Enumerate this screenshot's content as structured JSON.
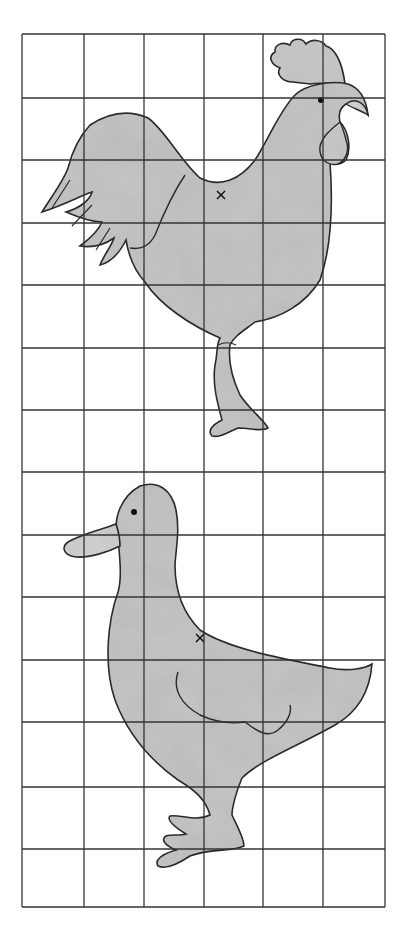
{
  "figure": {
    "grid": {
      "columns": 6,
      "rows": 14,
      "x_lines": [
        22,
        84,
        144,
        204,
        263,
        323,
        385
      ],
      "y_lines": [
        34,
        98,
        160,
        223,
        285,
        348,
        410,
        472,
        535,
        597,
        660,
        722,
        787,
        849,
        907
      ]
    },
    "colors": {
      "fill": "#c4c4c4",
      "outline": "#2a2a2a",
      "grid": "#333333",
      "background": "#ffffff"
    },
    "shapes": [
      {
        "name": "rooster",
        "marker": "x"
      },
      {
        "name": "duck",
        "marker": "x"
      }
    ]
  }
}
